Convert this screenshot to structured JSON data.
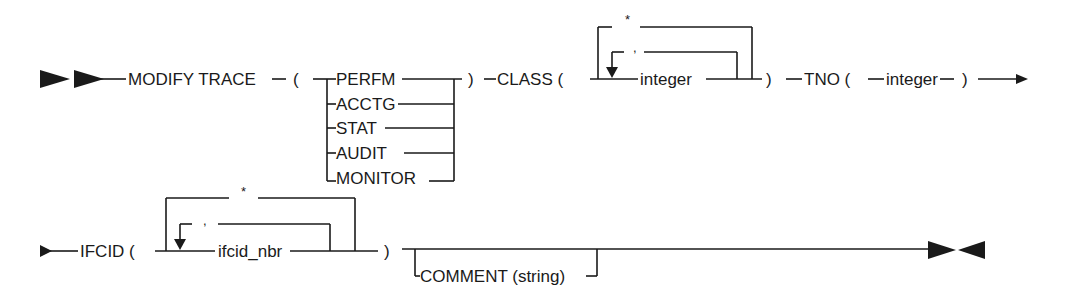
{
  "diagram": {
    "type": "syntax-railroad",
    "row1": {
      "command": "MODIFY TRACE",
      "open_paren": "(",
      "close_paren": ")",
      "trace_types": [
        "PERFM",
        "ACCTG",
        "STAT",
        "AUDIT",
        "MONITOR"
      ],
      "class_keyword": "CLASS (",
      "class_default": "*",
      "class_separator": ",",
      "class_value": "integer",
      "class_close": ")",
      "tno_keyword": "TNO (",
      "tno_value": "integer",
      "tno_close": ")"
    },
    "row2": {
      "ifcid_keyword": "IFCID (",
      "ifcid_default": "*",
      "ifcid_separator": ",",
      "ifcid_value": "ifcid_nbr",
      "ifcid_close": ")",
      "comment_option": "COMMENT (string)"
    },
    "colors": {
      "ink": "#1a1a1a",
      "background": "#ffffff"
    }
  }
}
